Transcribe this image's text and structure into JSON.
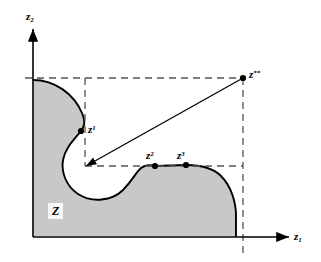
{
  "figure": {
    "background_color": "#ffffff",
    "region_fill_color": "#c8c8c8",
    "curve_color": "#000000",
    "axis_color": "#000000",
    "dashed_color": "#555555"
  },
  "axes": {
    "x_axis": {
      "label_base": "z",
      "label_sub": "1",
      "label_text": "z1",
      "origin_x": 33,
      "origin_y": 237,
      "tip_x": 289,
      "tip_y": 237,
      "label_pos_x": 294,
      "label_pos_y": 231
    },
    "y_axis": {
      "label_base": "z",
      "label_sub": "2",
      "label_text": "z2",
      "origin_x": 33,
      "origin_y": 237,
      "tip_x": 33,
      "tip_y": 29,
      "label_pos_x": 26,
      "label_pos_y": 11
    }
  },
  "region": {
    "name": "Z",
    "label": "Z",
    "label_pos_x": 48,
    "label_pos_y": 203
  },
  "points": [
    {
      "id": "z1",
      "label_base": "z",
      "label_sup": "1",
      "label_text": "z1",
      "x": 81,
      "y": 131,
      "label_pos_x": 88,
      "label_pos_y": 124
    },
    {
      "id": "z2",
      "label_base": "z",
      "label_sup": "2",
      "label_text": "z2",
      "x": 155,
      "y": 166,
      "label_pos_x": 146,
      "label_pos_y": 150
    },
    {
      "id": "z3",
      "label_base": "z",
      "label_sup": "3",
      "label_text": "z3",
      "x": 186,
      "y": 165,
      "label_pos_x": 177,
      "label_pos_y": 150
    },
    {
      "id": "zstarstar",
      "label_base": "z",
      "label_sup": "**",
      "label_text": "z**",
      "x": 243,
      "y": 78,
      "label_pos_x": 249,
      "label_pos_y": 69
    }
  ],
  "dashed_lines": [
    {
      "name": "ideal-horizontal-line",
      "x1": 25,
      "y1": 78,
      "x2": 243,
      "y2": 78
    },
    {
      "name": "z1-vertical-line",
      "x1": 85,
      "y1": 78,
      "x2": 85,
      "y2": 166
    },
    {
      "name": "lower-horizontal-line",
      "x1": 85,
      "y1": 166,
      "x2": 243,
      "y2": 166
    },
    {
      "name": "ideal-vertical-line",
      "x1": 243,
      "y1": 78,
      "x2": 243,
      "y2": 256
    }
  ],
  "arrow": {
    "name": "improvement-direction-arrow",
    "from_x": 243,
    "from_y": 78,
    "to_x": 86,
    "to_y": 166
  },
  "region_path": "M 33,80 C 55,80 74,94 82,113 C 86,123 84,127 81,131 C 74,140 65,148 63,160 C 61,172 66,186 78,194 C 92,203 112,201 123,190 C 133,180 136,172 141,168 C 146,164 151,165 155,166 L 186,165 C 200,165 212,167 221,176 C 231,186 236,202 236,216 L 236,236 L 33,236 Z",
  "boundary_path": "M 33,80 C 55,80 74,94 82,113 C 86,123 84,127 81,131 C 74,140 65,148 63,160 C 61,172 66,186 78,194 C 92,203 112,201 123,190 C 133,180 136,172 141,168 C 146,164 151,165 155,166 L 186,165 C 200,165 212,167 221,176 C 231,186 236,202 236,216 L 236,236"
}
